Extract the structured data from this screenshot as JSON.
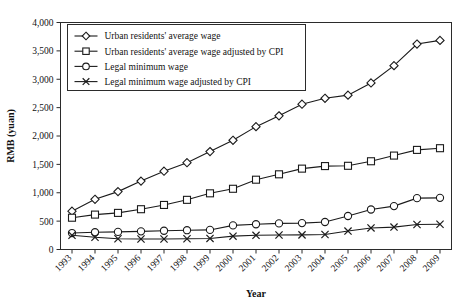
{
  "chart_data": {
    "type": "line",
    "title": "",
    "xlabel": "Year",
    "ylabel": "RMB (yuan)",
    "x": [
      1993,
      1994,
      1995,
      1996,
      1997,
      1998,
      1999,
      2000,
      2001,
      2002,
      2003,
      2004,
      2005,
      2006,
      2007,
      2008,
      2009
    ],
    "categories": [
      "1993",
      "1994",
      "1995",
      "1996",
      "1997",
      "1998",
      "1999",
      "2000",
      "2001",
      "2002",
      "2003",
      "2004",
      "2005",
      "2006",
      "2007",
      "2008",
      "2009"
    ],
    "ylim": [
      0,
      4000
    ],
    "ytick_values": [
      0,
      500,
      1000,
      1500,
      2000,
      2500,
      3000,
      3500,
      4000
    ],
    "ytick_labels": [
      "0",
      "500",
      "1,000",
      "1,500",
      "2,000",
      "2,500",
      "3,000",
      "3,500",
      "4,000"
    ],
    "grid": false,
    "legend_position": "top-left",
    "series": [
      {
        "name": "Urban residents' average wage",
        "marker": "diamond",
        "values": [
          675,
          885,
          1020,
          1205,
          1380,
          1530,
          1725,
          1925,
          2165,
          2355,
          2560,
          2665,
          2720,
          2935,
          3240,
          3620,
          3685
        ]
      },
      {
        "name": "Urban residents' average wage adjusted by CPI",
        "marker": "square",
        "values": [
          560,
          615,
          645,
          710,
          785,
          875,
          990,
          1070,
          1230,
          1325,
          1425,
          1470,
          1475,
          1555,
          1655,
          1755,
          1785
        ]
      },
      {
        "name": "Legal minimum wage",
        "marker": "circle",
        "values": [
          290,
          305,
          310,
          320,
          330,
          340,
          345,
          425,
          445,
          460,
          465,
          485,
          590,
          705,
          765,
          905,
          910
        ]
      },
      {
        "name": "Legal minimum wage adjusted by CPI",
        "marker": "x",
        "values": [
          250,
          215,
          190,
          185,
          185,
          190,
          195,
          235,
          250,
          255,
          258,
          265,
          325,
          380,
          395,
          440,
          445
        ]
      }
    ]
  },
  "legend": {
    "items": [
      {
        "label": "Urban residents' average wage",
        "marker": "diamond"
      },
      {
        "label": "Urban residents' average wage adjusted by CPI",
        "marker": "square"
      },
      {
        "label": "Legal minimum wage",
        "marker": "circle"
      },
      {
        "label": "Legal minimum wage adjusted by CPI",
        "marker": "x"
      }
    ]
  },
  "colors": {
    "line": "#1b1b1b",
    "frame": "#2b2b2b",
    "marker_fill": "#ffffff",
    "background": "#ffffff"
  }
}
